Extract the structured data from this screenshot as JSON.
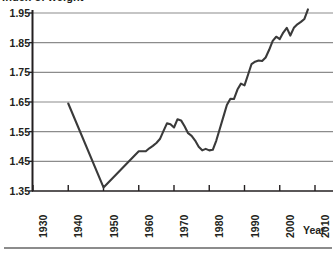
{
  "chart_data": {
    "type": "line",
    "title": "Index of weight",
    "xlabel": "Year",
    "ylabel": "",
    "xlim": [
      1930,
      2012
    ],
    "ylim": [
      1.35,
      1.97
    ],
    "grid": true,
    "legend": false,
    "xticks": [
      "1930",
      "1940",
      "1950",
      "1960",
      "1970",
      "1980",
      "1990",
      "2000",
      "2010"
    ],
    "xtick_values": [
      1930,
      1940,
      1950,
      1960,
      1970,
      1980,
      1990,
      2000,
      2010
    ],
    "yticks": [
      "1.35",
      "1.45",
      "1.55",
      "1.65",
      "1.75",
      "1.85",
      "1.95"
    ],
    "ytick_values": [
      1.35,
      1.45,
      1.55,
      1.65,
      1.75,
      1.85,
      1.95
    ],
    "line_color": "#3a3a3a",
    "grid_color": "#8c8c8c",
    "axis_color": "#231f20",
    "series": [
      {
        "name": "Index of weight",
        "x": [
          1940,
          1950,
          1960,
          1961,
          1962,
          1963,
          1964,
          1965,
          1966,
          1967,
          1968,
          1969,
          1970,
          1971,
          1972,
          1973,
          1974,
          1975,
          1976,
          1977,
          1978,
          1979,
          1980,
          1981,
          1982,
          1983,
          1984,
          1985,
          1986,
          1987,
          1988,
          1989,
          1990,
          1991,
          1992,
          1993,
          1994,
          1995,
          1996,
          1997,
          1998,
          1999,
          2000,
          2001,
          2002,
          2003,
          2004,
          2005,
          2006,
          2007,
          2008
        ],
        "values": [
          1.645,
          1.362,
          1.484,
          1.484,
          1.484,
          1.494,
          1.502,
          1.512,
          1.525,
          1.552,
          1.578,
          1.575,
          1.564,
          1.592,
          1.588,
          1.568,
          1.545,
          1.536,
          1.52,
          1.499,
          1.487,
          1.492,
          1.487,
          1.489,
          1.52,
          1.56,
          1.6,
          1.64,
          1.661,
          1.66,
          1.692,
          1.712,
          1.706,
          1.742,
          1.778,
          1.786,
          1.79,
          1.788,
          1.8,
          1.826,
          1.856,
          1.87,
          1.862,
          1.884,
          1.9,
          1.874,
          1.9,
          1.912,
          1.92,
          1.93,
          1.962
        ]
      }
    ]
  }
}
